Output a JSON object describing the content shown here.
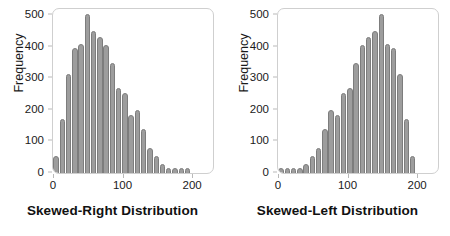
{
  "figure": {
    "background": "#ffffff",
    "bar_color": "#9d9d9d",
    "bar_edge_color": "#7d7d7d",
    "frame_color": "#cfcfcf",
    "text_color": "#1a1a1a"
  },
  "panels": [
    {
      "title": "Skewed-Right Distribution",
      "ylabel": "Frequency",
      "yticks": [
        0,
        100,
        200,
        300,
        400,
        500
      ],
      "xticks": [
        0,
        100,
        200
      ],
      "chart_index": 0
    },
    {
      "title": "Skewed-Left Distribution",
      "ylabel": "Frequency",
      "yticks": [
        0,
        100,
        200,
        300,
        400,
        500
      ],
      "xticks": [
        0,
        100,
        200
      ],
      "chart_index": 1
    }
  ],
  "chart_data": [
    {
      "type": "bar",
      "title": "Skewed-Right Distribution",
      "subtitle": "",
      "xlabel": "",
      "ylabel": "Frequency",
      "xlim": [
        0,
        230
      ],
      "ylim": [
        0,
        520
      ],
      "yticks": [
        0,
        100,
        200,
        300,
        400,
        500
      ],
      "xticks": [
        0,
        100,
        200
      ],
      "grid": false,
      "legend": false,
      "bin_width": 9,
      "x": [
        5,
        14,
        23,
        32,
        41,
        50,
        59,
        68,
        77,
        86,
        95,
        104,
        113,
        122,
        131,
        140,
        149,
        158,
        167,
        176,
        185,
        194,
        203,
        212,
        221
      ],
      "categories": [
        "5",
        "14",
        "23",
        "32",
        "41",
        "50",
        "59",
        "68",
        "77",
        "86",
        "95",
        "104",
        "113",
        "122",
        "131",
        "140",
        "149",
        "158",
        "167",
        "176",
        "185",
        "194",
        "203",
        "212",
        "221"
      ],
      "values": [
        55,
        170,
        315,
        395,
        410,
        505,
        450,
        430,
        405,
        350,
        270,
        255,
        185,
        200,
        140,
        80,
        55,
        30,
        12,
        10,
        8,
        6
      ]
    },
    {
      "type": "bar",
      "title": "Skewed-Left Distribution",
      "subtitle": "",
      "xlabel": "",
      "ylabel": "Frequency",
      "xlim": [
        0,
        230
      ],
      "ylim": [
        0,
        520
      ],
      "yticks": [
        0,
        100,
        200,
        300,
        400,
        500
      ],
      "xticks": [
        0,
        100,
        200
      ],
      "grid": false,
      "legend": false,
      "bin_width": 9,
      "x": [
        5,
        14,
        23,
        32,
        41,
        50,
        59,
        68,
        77,
        86,
        95,
        104,
        113,
        122,
        131,
        140,
        149,
        158,
        167,
        176,
        185,
        194,
        203,
        212,
        221
      ],
      "categories": [
        "5",
        "14",
        "23",
        "32",
        "41",
        "50",
        "59",
        "68",
        "77",
        "86",
        "95",
        "104",
        "113",
        "122",
        "131",
        "140",
        "149",
        "158",
        "167",
        "176",
        "185",
        "194",
        "203",
        "212",
        "221"
      ],
      "values": [
        6,
        8,
        10,
        12,
        30,
        55,
        80,
        140,
        200,
        185,
        255,
        270,
        350,
        405,
        430,
        450,
        505,
        410,
        395,
        315,
        170,
        55
      ]
    }
  ]
}
